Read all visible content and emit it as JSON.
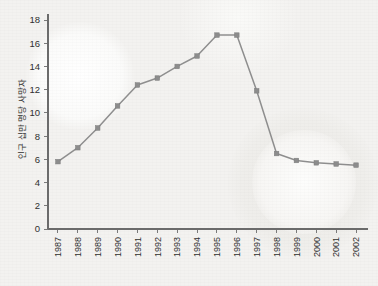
{
  "chart_data": {
    "type": "line",
    "title": "",
    "subtitle": "",
    "xlabel": "",
    "ylabel": "인구 십만 명당 사망자",
    "categories": [
      "1987",
      "1988",
      "1989",
      "1990",
      "1991",
      "1992",
      "1993",
      "1994",
      "1995",
      "1996",
      "1997",
      "1998",
      "1999",
      "2000",
      "2001",
      "2002"
    ],
    "x": [
      1987,
      1988,
      1989,
      1990,
      1991,
      1992,
      1993,
      1994,
      1995,
      1996,
      1997,
      1998,
      1999,
      2000,
      2001,
      2002
    ],
    "values": [
      5.8,
      7.0,
      8.7,
      10.6,
      12.4,
      13.0,
      14.0,
      14.9,
      16.7,
      16.7,
      11.9,
      6.5,
      5.9,
      5.7,
      5.6,
      5.5
    ],
    "series": [
      {
        "name": "인구 십만 명당 사망자",
        "values": [
          5.8,
          7.0,
          8.7,
          10.6,
          12.4,
          13.0,
          14.0,
          14.9,
          16.7,
          16.7,
          11.9,
          6.5,
          5.9,
          5.7,
          5.6,
          5.5
        ]
      }
    ],
    "ylim": [
      0,
      18
    ],
    "ytick_labels": [
      "0",
      "2",
      "4",
      "6",
      "8",
      "10",
      "12",
      "14",
      "16",
      "18"
    ],
    "yticks": [
      0,
      2,
      4,
      6,
      8,
      10,
      12,
      14,
      16,
      18
    ],
    "xlim": [
      1987,
      2002
    ],
    "grid": false,
    "legend": false,
    "legend_position": "none",
    "marker": "square",
    "colors": {
      "line": "#8e8e8e",
      "marker": "#8c8c8c",
      "axis": "#6b6b6b",
      "text": "#2f2f2f",
      "background": "#f3f2f0"
    }
  }
}
